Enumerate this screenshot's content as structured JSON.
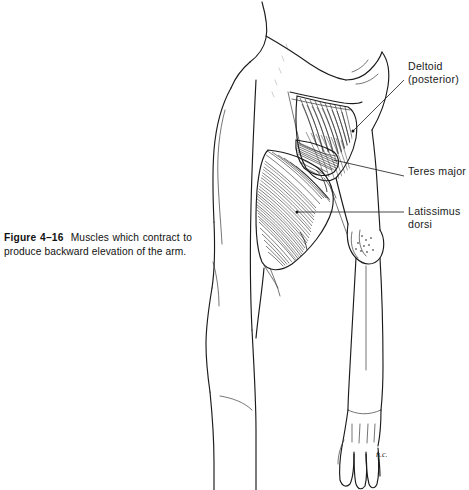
{
  "figure": {
    "number": "Figure 4–16",
    "caption_body": "Muscles which contract to produce backward elevation of the arm.",
    "artist_signature": "n.c."
  },
  "labels": [
    {
      "id": "deltoid",
      "text": "Deltoid\n(posterior)",
      "x": 408,
      "y": 60
    },
    {
      "id": "teres",
      "text": "Teres major",
      "x": 408,
      "y": 165
    },
    {
      "id": "latissimus",
      "text": "Latissimus\n    dorsi",
      "x": 408,
      "y": 205
    }
  ],
  "colors": {
    "background": "#ffffff",
    "ink": "#1b1b1b",
    "hatching": "#262626",
    "caption_text": "#111111"
  },
  "view": {
    "width": 469,
    "height": 490
  }
}
